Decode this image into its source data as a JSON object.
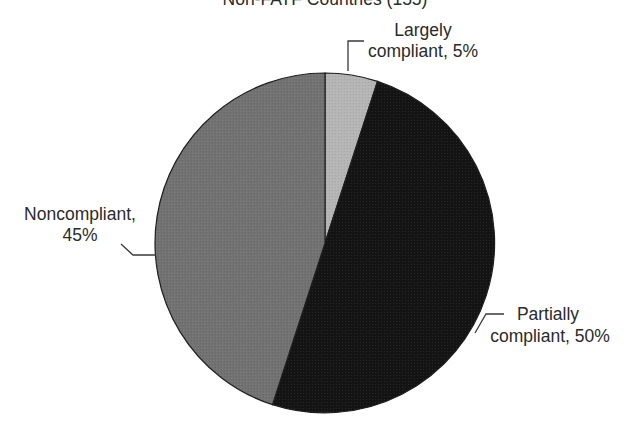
{
  "chart_data": {
    "type": "pie",
    "title": "Non-FATF Countries (155)",
    "start_angle_deg": 0,
    "direction": "clockwise",
    "slices": [
      {
        "label": "Largely compliant",
        "value": 5,
        "display": [
          "Largely",
          "compliant, 5%"
        ],
        "color": "#b5b5b5"
      },
      {
        "label": "Partially compliant",
        "value": 50,
        "display": [
          "Partially",
          "compliant, 50%"
        ],
        "color": "#141414"
      },
      {
        "label": "Noncompliant",
        "value": 45,
        "display": [
          "Noncompliant,",
          "45%"
        ],
        "color": "#727272"
      }
    ]
  },
  "labels": {
    "largely": {
      "line1": "Largely",
      "line2": "compliant, 5%"
    },
    "partially": {
      "line1": "Partially",
      "line2": "compliant, 50%"
    },
    "noncompliant": {
      "line1": "Noncompliant,",
      "line2": "45%"
    }
  },
  "title": "Non-FATF Countries (155)",
  "colors": {
    "outline": "#1e1e1e",
    "leader": "#3a3a3a",
    "text": "#2a2a2a"
  }
}
